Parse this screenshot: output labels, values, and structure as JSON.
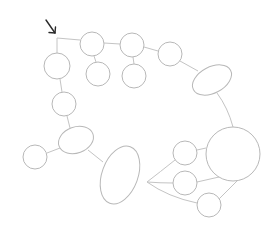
{
  "diagram": {
    "type": "tree-graph",
    "colors": {
      "node_stroke": "#b8b8b8",
      "edge_stroke": "#c4c4c4",
      "arrow": "#2a2a2a",
      "background": "#ffffff"
    },
    "start_marker": {
      "icon": "arrow-down-right-icon",
      "from": [
        46,
        20
      ],
      "to": [
        55,
        33
      ]
    },
    "nodes": [
      {
        "id": "A",
        "shape": "circle",
        "cx": 92,
        "cy": 44,
        "r": 12
      },
      {
        "id": "A1",
        "shape": "circle",
        "cx": 98,
        "cy": 74,
        "r": 12
      },
      {
        "id": "B",
        "shape": "circle",
        "cx": 132,
        "cy": 45,
        "r": 12
      },
      {
        "id": "B1",
        "shape": "circle",
        "cx": 134,
        "cy": 76,
        "r": 12
      },
      {
        "id": "C",
        "shape": "circle",
        "cx": 170,
        "cy": 54,
        "r": 12
      },
      {
        "id": "D",
        "shape": "ellipse",
        "cx": 212,
        "cy": 80,
        "rx": 21,
        "ry": 13,
        "rotate": -28
      },
      {
        "id": "E",
        "shape": "circle",
        "cx": 57,
        "cy": 66,
        "r": 13
      },
      {
        "id": "F",
        "shape": "circle",
        "cx": 64,
        "cy": 104,
        "r": 12
      },
      {
        "id": "G",
        "shape": "ellipse",
        "cx": 76,
        "cy": 140,
        "rx": 18,
        "ry": 13,
        "rotate": -20
      },
      {
        "id": "H",
        "shape": "circle",
        "cx": 35,
        "cy": 157,
        "r": 12
      },
      {
        "id": "I",
        "shape": "ellipse",
        "cx": 120,
        "cy": 175,
        "rx": 18,
        "ry": 30,
        "rotate": 20
      },
      {
        "id": "J",
        "shape": "circle",
        "cx": 233,
        "cy": 154,
        "r": 27
      },
      {
        "id": "K",
        "shape": "circle",
        "cx": 185,
        "cy": 153,
        "r": 12
      },
      {
        "id": "L",
        "shape": "circle",
        "cx": 185,
        "cy": 183,
        "r": 12
      },
      {
        "id": "M",
        "shape": "circle",
        "cx": 209,
        "cy": 205,
        "r": 12
      }
    ],
    "edges": [
      {
        "from": "root",
        "to": "A",
        "d": "M57 38 L80 40"
      },
      {
        "from": "root",
        "to": "E",
        "d": "M57 38 L57 53"
      },
      {
        "from": "A",
        "to": "A1",
        "d": "M94 56 L96 62"
      },
      {
        "from": "A",
        "to": "B",
        "d": "M104 43 L120 44"
      },
      {
        "from": "B",
        "to": "B1",
        "d": "M133 57 L134 64"
      },
      {
        "from": "B",
        "to": "C",
        "d": "M144 47 L158 51"
      },
      {
        "from": "C",
        "to": "D",
        "d": "M180 61 L198 71"
      },
      {
        "from": "D",
        "to": "J",
        "d": "M217 93 Q228 108 233 127"
      },
      {
        "from": "E",
        "to": "F",
        "d": "M60 79 L62 92"
      },
      {
        "from": "F",
        "to": "G",
        "d": "M67 116 L70 128"
      },
      {
        "from": "G",
        "to": "H",
        "d": "M60 148 L47 153"
      },
      {
        "from": "G",
        "to": "I",
        "d": "M88 150 L103 162"
      },
      {
        "from": "I",
        "to": "K",
        "d": "M147 182 Q160 172 175 160"
      },
      {
        "from": "I",
        "to": "L",
        "d": "M147 182 Q160 183 173 183"
      },
      {
        "from": "I",
        "to": "M",
        "d": "M147 182 Q168 197 197 203"
      },
      {
        "from": "K",
        "to": "J",
        "d": "M197 150 L206 148"
      },
      {
        "from": "L",
        "to": "J",
        "d": "M197 182 L219 177"
      },
      {
        "from": "M",
        "to": "J",
        "d": "M219 199 L237 181"
      }
    ]
  }
}
